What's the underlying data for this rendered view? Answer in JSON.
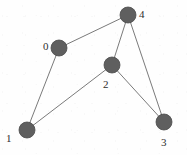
{
  "figure": {
    "kind": "undirected-graph",
    "width": 187,
    "height": 155,
    "background_color": "#fefefe",
    "node_color": "#5f5f5f",
    "node_stroke_color": "#4a4a4a",
    "edge_color": "#7a7a7a",
    "label_color": "#2e2e2e",
    "node_radius": 8
  },
  "chart_data": {
    "type": "diagram",
    "title": "",
    "nodes": [
      {
        "id": "0",
        "label": "0",
        "x": 59,
        "y": 48,
        "label_x": 43,
        "label_y": 41
      },
      {
        "id": "1",
        "label": "1",
        "x": 27,
        "y": 130,
        "label_x": 6,
        "label_y": 133
      },
      {
        "id": "2",
        "label": "2",
        "x": 112,
        "y": 65,
        "label_x": 103,
        "label_y": 79
      },
      {
        "id": "3",
        "label": "3",
        "x": 164,
        "y": 122,
        "label_x": 161,
        "label_y": 137
      },
      {
        "id": "4",
        "label": "4",
        "x": 128,
        "y": 15,
        "label_x": 139,
        "label_y": 9
      }
    ],
    "edges": [
      {
        "source": "0",
        "target": "4"
      },
      {
        "source": "0",
        "target": "1"
      },
      {
        "source": "1",
        "target": "2"
      },
      {
        "source": "2",
        "target": "4"
      },
      {
        "source": "2",
        "target": "3"
      },
      {
        "source": "3",
        "target": "4"
      }
    ]
  }
}
